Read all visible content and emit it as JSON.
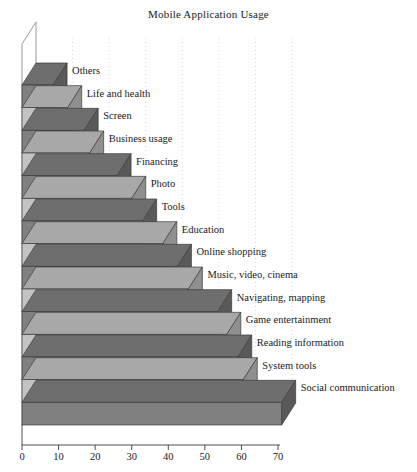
{
  "chart_data": {
    "type": "bar",
    "orientation": "horizontal",
    "style": "3d",
    "title": "Mobile Application Usage",
    "xlabel": "",
    "ylabel": "",
    "xlim": [
      0,
      70
    ],
    "xticks": [
      0,
      10,
      20,
      30,
      40,
      50,
      60,
      70
    ],
    "grid": "vertical-dotted",
    "legend": "none",
    "categories": [
      "Others",
      "Life and health",
      "Screen",
      "Business usage",
      "Financing",
      "Photo",
      "Tools",
      "Education",
      "Online shopping",
      "Music, video, cinema",
      "Navigating, mapping",
      "Game entertainment",
      "Reading information",
      "System tools",
      "Social communication"
    ],
    "values": [
      8.5,
      12.5,
      17,
      18.5,
      26,
      30,
      33,
      38.5,
      42.5,
      45.5,
      53.5,
      56,
      59,
      60.5,
      71
    ],
    "colors": {
      "bar_dark_front": "#808080",
      "bar_light_front": "#c3c3c3",
      "bar_dark_side": "#595959",
      "bar_light_side": "#8f8f8f",
      "bar_dark_top": "#6e6e6e",
      "bar_light_top": "#a8a8a8",
      "axis": "#4d4d4d",
      "gridline": "#d8d8d8",
      "text": "#1a1a1a",
      "background": "#ffffff"
    }
  },
  "axis": {
    "tick_labels": [
      "0",
      "10",
      "20",
      "30",
      "40",
      "50",
      "60",
      "70"
    ]
  }
}
